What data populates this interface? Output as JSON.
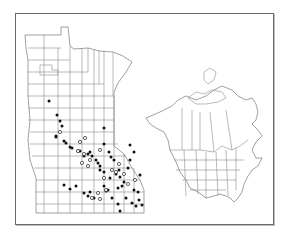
{
  "figure": {
    "type": "distribution-map",
    "main_region": "Minnesota (county outlines)",
    "inset_region": "North America (Canada provinces/territories and US states)",
    "legend": null,
    "colors": {
      "frame": "#6a6a6a",
      "boundaries": "#8c8c8c",
      "filled_marker": "#111111",
      "open_marker": "#ffffff"
    }
  },
  "markers": {
    "filled": [
      [
        49,
        101
      ],
      [
        57,
        115
      ],
      [
        60,
        121
      ],
      [
        62,
        126
      ],
      [
        104,
        128
      ],
      [
        104,
        144
      ],
      [
        109,
        152
      ],
      [
        111,
        157
      ],
      [
        114,
        160
      ],
      [
        56,
        136
      ],
      [
        56,
        137
      ],
      [
        64,
        141
      ],
      [
        66,
        143
      ],
      [
        70,
        147
      ],
      [
        72,
        148
      ],
      [
        78,
        151
      ],
      [
        80,
        151
      ],
      [
        84,
        156
      ],
      [
        88,
        154
      ],
      [
        90,
        152
      ],
      [
        92,
        156
      ],
      [
        96,
        160
      ],
      [
        98,
        163
      ],
      [
        100,
        166
      ],
      [
        100,
        170
      ],
      [
        104,
        172
      ],
      [
        110,
        178
      ],
      [
        116,
        174
      ],
      [
        119,
        170
      ],
      [
        120,
        177
      ],
      [
        122,
        186
      ],
      [
        124,
        182
      ],
      [
        90,
        192
      ],
      [
        94,
        198
      ],
      [
        104,
        186
      ],
      [
        108,
        190
      ],
      [
        112,
        198
      ],
      [
        118,
        188
      ],
      [
        134,
        190
      ],
      [
        128,
        168
      ],
      [
        130,
        160
      ],
      [
        134,
        152
      ],
      [
        130,
        145
      ],
      [
        140,
        175
      ],
      [
        138,
        192
      ],
      [
        132,
        203
      ],
      [
        126,
        198
      ],
      [
        139,
        200
      ],
      [
        136,
        206
      ],
      [
        142,
        205
      ],
      [
        120,
        211
      ],
      [
        118,
        204
      ],
      [
        106,
        191
      ],
      [
        88,
        196
      ],
      [
        84,
        193
      ],
      [
        76,
        186
      ],
      [
        70,
        189
      ],
      [
        64,
        185
      ]
    ],
    "open": [
      [
        60,
        132
      ],
      [
        80,
        142
      ],
      [
        85,
        138
      ],
      [
        78,
        151
      ],
      [
        84,
        154
      ],
      [
        100,
        150
      ],
      [
        82,
        163
      ],
      [
        88,
        166
      ],
      [
        104,
        178
      ],
      [
        106,
        190
      ],
      [
        98,
        193
      ],
      [
        92,
        198
      ],
      [
        100,
        199
      ],
      [
        128,
        184
      ],
      [
        116,
        172
      ],
      [
        119,
        164
      ],
      [
        124,
        174
      ],
      [
        112,
        170
      ],
      [
        135,
        180
      ],
      [
        90,
        160
      ]
    ]
  }
}
